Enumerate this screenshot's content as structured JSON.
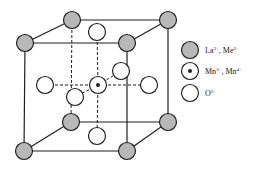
{
  "colors": {
    "line": "#1f1f1f",
    "a_site_fill": "#b8b8b8",
    "b_site_fill": "#ffffff",
    "o_fill": "#ffffff",
    "background": "#ffffff"
  },
  "legend": [
    {
      "symbol": "a-site-ion",
      "label": "La",
      "sup": "3+",
      "sep": ", ",
      "label2": "Me",
      "sup2": "2+"
    },
    {
      "symbol": "b-site-ion",
      "label": "Mn",
      "sup": "3+",
      "sep": ", ",
      "label2": "Mn",
      "sup2": "4+"
    },
    {
      "symbol": "oxygen-ion",
      "label": "O",
      "sup": "2-",
      "sep": "",
      "label2": "",
      "sup2": ""
    }
  ],
  "lattice": {
    "a_sites": [
      {
        "x": 72,
        "y": 20
      },
      {
        "x": 168,
        "y": 20
      },
      {
        "x": 25,
        "y": 43
      },
      {
        "x": 127,
        "y": 43
      },
      {
        "x": 71,
        "y": 122
      },
      {
        "x": 168,
        "y": 122
      },
      {
        "x": 24,
        "y": 151
      },
      {
        "x": 127,
        "y": 151
      }
    ],
    "b_site": {
      "x": 98,
      "y": 85
    },
    "o_sites": [
      {
        "x": 97,
        "y": 32
      },
      {
        "x": 45,
        "y": 85
      },
      {
        "x": 149,
        "y": 85
      },
      {
        "x": 121,
        "y": 71
      },
      {
        "x": 75,
        "y": 97
      },
      {
        "x": 97,
        "y": 136
      }
    ]
  }
}
